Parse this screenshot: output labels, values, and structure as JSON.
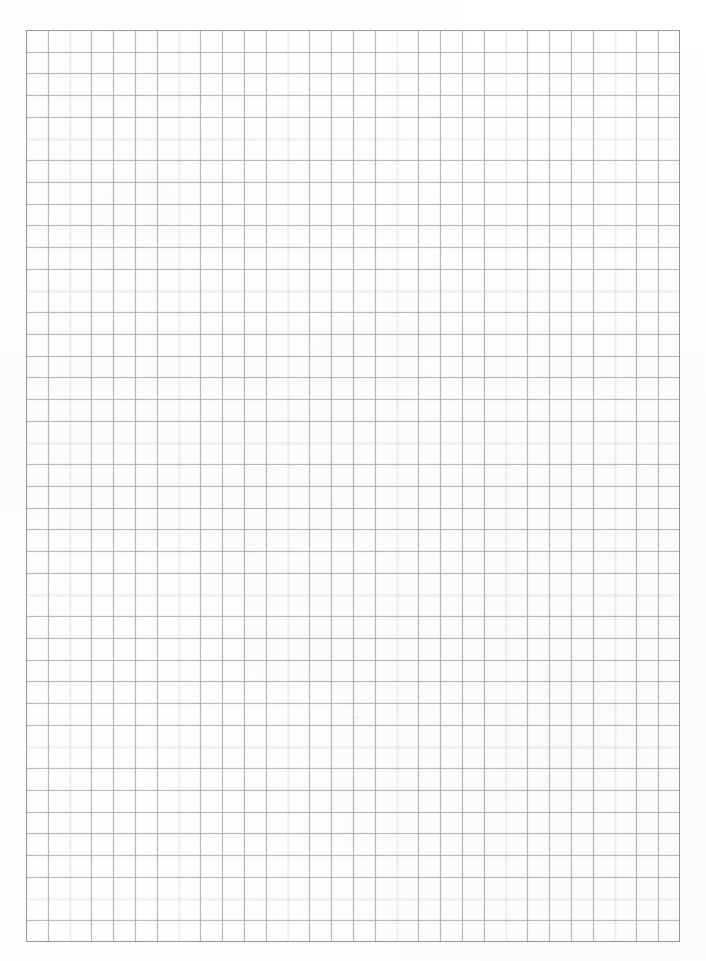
{
  "document": {
    "kind": "grid-paper-sheet",
    "title": "Blank grid paper",
    "page_width": 706,
    "page_height": 961,
    "background_color": "#fefefe",
    "text_content": "",
    "annotations": []
  },
  "grid": {
    "label": "grid",
    "origin_x": 26,
    "origin_y": 30,
    "width": 654,
    "height": 912,
    "right_edge_x": 680,
    "bottom_edge_y": 942,
    "columns": 30,
    "rows": 42,
    "cell_width": 21.8,
    "cell_height": 21.7,
    "line_color": "#92929 6",
    "line_color_hex": "#c2c2c4",
    "line_width_px": 1,
    "border_color_hex": "#b4b4b8",
    "has_major_gridlines": false,
    "has_labels": false
  },
  "marks": {
    "label": "scan specks",
    "items": [
      {
        "name": "speck-upper-left",
        "x": 18,
        "y": 77,
        "size": 2
      },
      {
        "name": "speck-upper-mid",
        "x": 353,
        "y": 124,
        "size": 2
      },
      {
        "name": "speck-lower-mid",
        "x": 356,
        "y": 716,
        "size": 3
      }
    ]
  },
  "chart_data": {
    "type": "table",
    "title": "",
    "xlabel": "",
    "ylabel": "",
    "categories": [],
    "values": [],
    "series": [],
    "grid": true,
    "legend": "none",
    "note": "Empty ruled grid paper: 30 columns by 42 rows of square cells, no plotted data."
  }
}
